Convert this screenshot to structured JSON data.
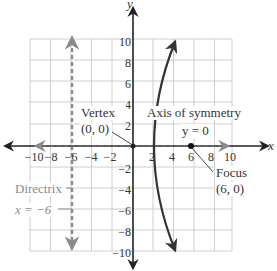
{
  "figure": {
    "axes": {
      "x_label": "x",
      "y_label": "y",
      "x_ticks": [
        "−10",
        "−8",
        "−6",
        "−4",
        "−2",
        "2",
        "4",
        "6",
        "8",
        "10"
      ],
      "y_ticks": [
        "10",
        "8",
        "6",
        "4",
        "2",
        "−2",
        "−4",
        "−6",
        "−8",
        "−10"
      ],
      "x_range": [
        -10,
        10
      ],
      "y_range": [
        -10,
        10
      ],
      "grid_step": 2
    },
    "annotations": {
      "vertex_label": "Vertex",
      "vertex_coords": "(0, 0)",
      "axis_label": "Axis of symmetry",
      "axis_equation": "y = 0",
      "focus_label": "Focus",
      "focus_coords": "(6, 0)",
      "directrix_label": "Directrix",
      "directrix_equation": "x = −6"
    },
    "colors": {
      "curve": "#333333",
      "axis": "#222222",
      "directrix": "#8a8a8a",
      "grid": "#c8c8c8",
      "symmetry_axis": "#666666"
    },
    "elements": {
      "vertex": [
        0,
        0
      ],
      "focus": [
        6,
        0
      ],
      "directrix_x": -6,
      "symmetry_axis_y": 0,
      "parabola": {
        "equation": "y^2 = 24x",
        "opens": "right",
        "p": 6
      }
    }
  }
}
